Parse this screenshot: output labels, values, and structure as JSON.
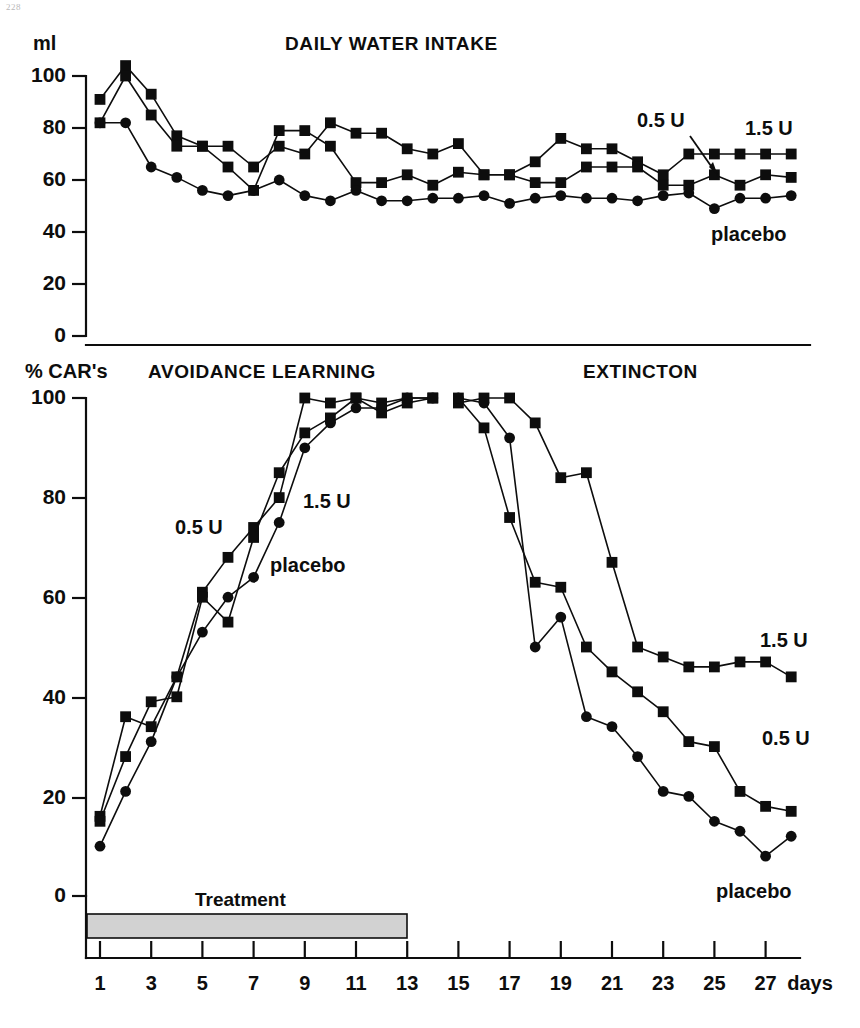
{
  "page": {
    "marker": "228"
  },
  "figure": {
    "background": "#ffffff",
    "ink_color": "#0d0d0d",
    "treatment_bar_color": "#d2d2d2"
  },
  "panels": {
    "top": {
      "title": "DAILY WATER INTAKE",
      "y_unit": "ml",
      "y_ticks": [
        0,
        20,
        40,
        60,
        80,
        100
      ],
      "series_labels": {
        "dose_low": "0.5 U",
        "dose_high": "1.5 U",
        "control": "placebo"
      }
    },
    "bottom": {
      "title_left": "AVOIDANCE LEARNING",
      "title_right": "EXTINCTON",
      "y_unit": "% CAR's",
      "y_ticks": [
        0,
        20,
        40,
        60,
        80,
        100
      ],
      "treatment_label": "Treatment",
      "x_unit": "days",
      "x_ticks": [
        1,
        3,
        5,
        7,
        9,
        11,
        13,
        15,
        17,
        19,
        21,
        23,
        25,
        27
      ],
      "series_labels": {
        "dose_low_learning": "0.5 U",
        "dose_high_learning": "1.5 U",
        "control_learning": "placebo",
        "dose_high_extinction": "1.5 U",
        "dose_low_extinction": "0.5 U",
        "control_extinction": "placebo"
      }
    }
  },
  "chart_data": [
    {
      "type": "line",
      "id": "daily-water-intake",
      "title": "DAILY WATER INTAKE",
      "xlabel": "days",
      "ylabel": "ml",
      "ylim": [
        0,
        100
      ],
      "xlim": [
        1,
        28
      ],
      "grid": false,
      "legend_position": "inline-annotations",
      "x": [
        1,
        2,
        3,
        4,
        5,
        6,
        7,
        8,
        9,
        10,
        11,
        12,
        13,
        14,
        15,
        16,
        17,
        18,
        19,
        20,
        21,
        22,
        23,
        24,
        25,
        26,
        27,
        28
      ],
      "series": [
        {
          "name": "0.5 U",
          "marker": "square",
          "values": [
            91,
            104,
            93,
            77,
            73,
            73,
            65,
            73,
            70,
            82,
            78,
            78,
            72,
            70,
            74,
            62,
            62,
            67,
            76,
            72,
            72,
            67,
            62,
            70,
            70,
            70,
            70,
            70
          ]
        },
        {
          "name": "1.5 U",
          "marker": "square",
          "values": [
            82,
            100,
            85,
            73,
            73,
            65,
            56,
            79,
            79,
            73,
            59,
            59,
            62,
            58,
            63,
            62,
            62,
            59,
            59,
            65,
            65,
            65,
            58,
            58,
            62,
            58,
            62,
            61
          ]
        },
        {
          "name": "placebo",
          "marker": "circle",
          "values": [
            82,
            82,
            65,
            61,
            56,
            54,
            56,
            60,
            54,
            52,
            56,
            52,
            52,
            53,
            53,
            54,
            51,
            53,
            54,
            53,
            53,
            52,
            54,
            55,
            49,
            53,
            53,
            54
          ]
        }
      ]
    },
    {
      "type": "line",
      "id": "avoidance-learning-extinction",
      "title_left": "AVOIDANCE LEARNING",
      "title_right": "EXTINCTON",
      "xlabel": "days",
      "ylabel": "% CAR's",
      "ylim": [
        0,
        100
      ],
      "xlim": [
        1,
        28
      ],
      "grid": false,
      "legend_position": "inline-annotations",
      "phases": [
        {
          "name": "AVOIDANCE LEARNING",
          "x_start": 1,
          "x_end": 14
        },
        {
          "name": "EXTINCTON",
          "x_start": 15,
          "x_end": 28
        }
      ],
      "treatment_bar": {
        "label": "Treatment",
        "x_start": 0,
        "x_end": 13
      },
      "learning": {
        "x": [
          1,
          2,
          3,
          4,
          5,
          6,
          7,
          8,
          9,
          10,
          11,
          12,
          13,
          14
        ],
        "series": [
          {
            "name": "0.5 U",
            "marker": "square",
            "values": [
              16,
              36,
              34,
              44,
              61,
              68,
              74,
              80,
              100,
              99,
              100,
              99,
              100,
              100
            ]
          },
          {
            "name": "1.5 U",
            "marker": "square",
            "values": [
              15,
              28,
              39,
              40,
              60,
              55,
              72,
              85,
              93,
              96,
              100,
              97,
              99,
              100
            ]
          },
          {
            "name": "placebo",
            "marker": "circle",
            "values": [
              10,
              21,
              31,
              44,
              53,
              60,
              64,
              75,
              90,
              95,
              98,
              98,
              100,
              100
            ]
          }
        ]
      },
      "extinction": {
        "x": [
          15,
          16,
          17,
          18,
          19,
          20,
          21,
          22,
          23,
          24,
          25,
          26,
          27,
          28
        ],
        "series": [
          {
            "name": "1.5 U",
            "marker": "square",
            "values": [
              99,
              100,
              100,
              95,
              84,
              85,
              67,
              50,
              48,
              46,
              46,
              47,
              47,
              44
            ]
          },
          {
            "name": "0.5 U",
            "marker": "square",
            "values": [
              100,
              94,
              76,
              63,
              62,
              50,
              45,
              41,
              37,
              31,
              30,
              21,
              18,
              17
            ]
          },
          {
            "name": "placebo",
            "marker": "circle",
            "values": [
              100,
              99,
              92,
              50,
              56,
              36,
              34,
              28,
              21,
              20,
              15,
              13,
              8,
              12
            ]
          }
        ]
      }
    }
  ]
}
